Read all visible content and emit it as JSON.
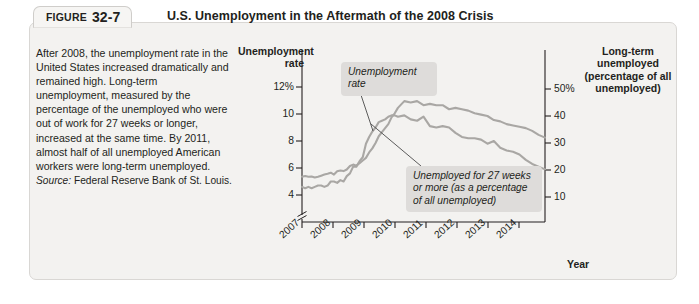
{
  "figure": {
    "label": "FIGURE",
    "number": "32-7",
    "title": "U.S. Unemployment in the Aftermath of the 2008 Crisis"
  },
  "caption": {
    "body": "After 2008, the unemployment rate in the United States increased dramatically and remained high. Long-term unemployment, measured by the percentage of the unemployed who were out of work for 27 weeks or longer, increased at the same time. By 2011, almost half of all unemployed American workers were long-term unemployed.",
    "source_label": "Source:",
    "source_text": "Federal Reserve Bank of St. Louis."
  },
  "chart_data": {
    "type": "line",
    "title": "U.S. Unemployment in the Aftermath of the 2008 Crisis",
    "xlabel": "Year",
    "left_axis": {
      "label": "Unemployment rate",
      "ticks": [
        "12%",
        "10",
        "8",
        "6",
        "4"
      ],
      "values": [
        12,
        10,
        8,
        6,
        4
      ],
      "range": [
        3,
        13
      ],
      "axis_break": true
    },
    "right_axis": {
      "label": "Long-term unemployed (percentage of all unemployed)",
      "ticks": [
        "50%",
        "40",
        "30",
        "20",
        "10"
      ],
      "values": [
        50,
        40,
        30,
        20,
        10
      ],
      "range": [
        5,
        55
      ]
    },
    "x_ticks": [
      "2007",
      "2008",
      "2009",
      "2010",
      "2011",
      "2012",
      "2013",
      "2014"
    ],
    "xlim": [
      2007,
      2014.6
    ],
    "grid": false,
    "legend": "annotations",
    "series": [
      {
        "name": "Unemployment rate",
        "axis": "left",
        "unit": "percent",
        "color": "#a9a7a4",
        "x": [
          2007.0,
          2007.1,
          2007.2,
          2007.3,
          2007.4,
          2007.5,
          2007.6,
          2007.7,
          2007.8,
          2007.9,
          2008.0,
          2008.1,
          2008.2,
          2008.3,
          2008.4,
          2008.5,
          2008.6,
          2008.7,
          2008.8,
          2008.9,
          2009.0,
          2009.1,
          2009.2,
          2009.3,
          2009.4,
          2009.5,
          2009.6,
          2009.7,
          2009.8,
          2009.9,
          2010.0,
          2010.2,
          2010.4,
          2010.6,
          2010.8,
          2011.0,
          2011.2,
          2011.4,
          2011.6,
          2011.8,
          2012.0,
          2012.2,
          2012.4,
          2012.6,
          2012.8,
          2013.0,
          2013.2,
          2013.4,
          2013.6,
          2013.8,
          2014.0,
          2014.2,
          2014.4,
          2014.6
        ],
        "values": [
          4.6,
          4.5,
          4.6,
          4.5,
          4.6,
          4.7,
          4.7,
          4.6,
          4.7,
          5.0,
          5.0,
          4.9,
          5.1,
          5.0,
          5.4,
          5.6,
          6.1,
          6.1,
          6.5,
          6.8,
          7.8,
          8.3,
          8.7,
          9.0,
          9.4,
          9.5,
          9.6,
          9.8,
          9.9,
          9.9,
          9.8,
          9.9,
          9.6,
          9.5,
          9.8,
          9.1,
          9.0,
          9.1,
          9.0,
          8.6,
          8.3,
          8.2,
          8.2,
          8.1,
          7.8,
          8.0,
          7.5,
          7.3,
          7.2,
          7.0,
          6.6,
          6.3,
          6.1,
          5.9
        ]
      },
      {
        "name": "Unemployed for 27 weeks or more (as a percentage of all unemployed)",
        "axis": "right",
        "unit": "percent",
        "color": "#a9a7a4",
        "x": [
          2007.0,
          2007.1,
          2007.2,
          2007.3,
          2007.4,
          2007.5,
          2007.6,
          2007.7,
          2007.8,
          2007.9,
          2008.0,
          2008.1,
          2008.2,
          2008.3,
          2008.4,
          2008.5,
          2008.6,
          2008.7,
          2008.8,
          2008.9,
          2009.0,
          2009.1,
          2009.2,
          2009.3,
          2009.4,
          2009.5,
          2009.6,
          2009.7,
          2009.8,
          2009.9,
          2010.0,
          2010.2,
          2010.4,
          2010.6,
          2010.8,
          2011.0,
          2011.2,
          2011.4,
          2011.6,
          2011.8,
          2012.0,
          2012.2,
          2012.4,
          2012.6,
          2012.8,
          2013.0,
          2013.2,
          2013.4,
          2013.6,
          2013.8,
          2014.0,
          2014.2,
          2014.4,
          2014.6
        ],
        "values": [
          17.5,
          17.8,
          17.5,
          17.6,
          17.2,
          17.5,
          17.9,
          18.3,
          18.6,
          19.0,
          18.3,
          19.5,
          19.8,
          19.6,
          20.2,
          21.5,
          22.0,
          21.6,
          22.5,
          23.5,
          24.5,
          26.5,
          28.0,
          30.0,
          32.5,
          34.0,
          35.5,
          37.0,
          39.5,
          41.0,
          43.0,
          45.5,
          45.0,
          45.5,
          44.0,
          44.5,
          44.0,
          44.0,
          42.5,
          43.0,
          42.5,
          42.0,
          41.0,
          40.5,
          40.0,
          38.5,
          38.0,
          37.0,
          36.5,
          36.0,
          35.5,
          34.5,
          33.0,
          32.0
        ]
      }
    ],
    "annotations": [
      {
        "id": "unemployment-rate",
        "text": "Unemployment rate",
        "lines": [
          "Unemployment",
          "rate"
        ]
      },
      {
        "id": "long-term",
        "text": "Unemployed for 27 weeks or more (as a percentage of all unemployed)",
        "lines": [
          "Unemployed for 27 weeks",
          "or more (as a percentage",
          "of all unemployed)"
        ]
      }
    ]
  }
}
